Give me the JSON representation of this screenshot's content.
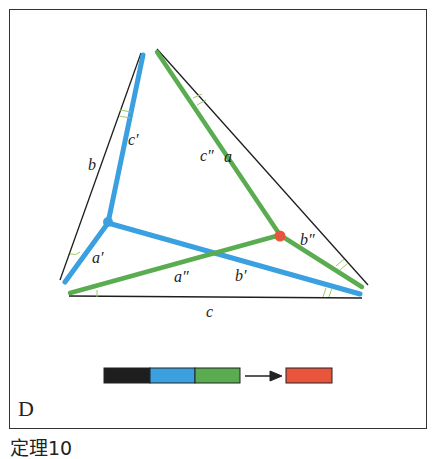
{
  "figure": {
    "panel_letter": "D",
    "caption": "定理10"
  },
  "labels": {
    "a": "a",
    "b": "b",
    "c": "c",
    "a1": "a′",
    "b1": "b′",
    "c1": "c′",
    "a2": "a″",
    "b2": "b″",
    "c2": "c″"
  },
  "colors": {
    "black": "#1e1e1e",
    "blue": "#3aa0e0",
    "green": "#5aac50",
    "red": "#e8553c"
  },
  "legend": {
    "sequence": [
      "black",
      "blue",
      "green"
    ],
    "result": "red",
    "arrow": "arrow-right-icon"
  }
}
